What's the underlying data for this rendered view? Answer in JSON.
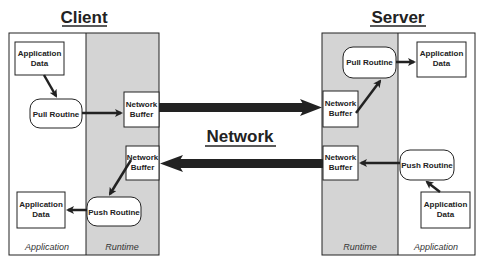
{
  "diagram": {
    "colors": {
      "runtime_fill": "#d4d4d4",
      "stroke": "#222222",
      "background": "#ffffff"
    },
    "client": {
      "title": "Client",
      "top_app_data": [
        "Application",
        "Data"
      ],
      "pull_routine": "Pull Routine",
      "top_buffer": [
        "Network",
        "Buffer"
      ],
      "bottom_buffer": [
        "Network",
        "Buffer"
      ],
      "push_routine": "Push Routine",
      "bottom_app_data": [
        "Application",
        "Data"
      ],
      "footer_application": "Application",
      "footer_runtime": "Runtime"
    },
    "network": {
      "label": "Network"
    },
    "server": {
      "title": "Server",
      "top_buffer": [
        "Network",
        "Buffer"
      ],
      "pull_routine": "Pull Routine",
      "top_app_data": [
        "Application",
        "Data"
      ],
      "bottom_buffer": [
        "Network",
        "Buffer"
      ],
      "push_routine": "Push Routine",
      "bottom_app_data": [
        "Application",
        "Data"
      ],
      "footer_runtime": "Runtime",
      "footer_application": "Application"
    }
  }
}
